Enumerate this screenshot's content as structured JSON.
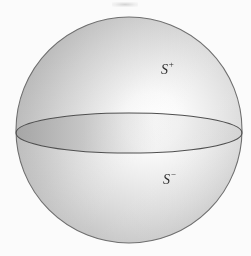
{
  "figure": {
    "caption": "",
    "background_color": "#fbfbfb",
    "width": 251,
    "height": 256
  },
  "sphere": {
    "name": "shaded-sphere",
    "center_x": 129,
    "center_y": 130,
    "radius": 113,
    "outline_color": "#6b6b6b",
    "fill_light": "#ffffff",
    "fill_mid": "#c9c9c9",
    "fill_dark": "#a6a6a6",
    "highlight_x": 162,
    "highlight_y": 122
  },
  "equator": {
    "name": "equator-ellipse",
    "center_x": 129,
    "center_y": 133,
    "radius_x": 113,
    "radius_y": 20,
    "stroke_color": "#555555",
    "band_fill": "#b4b4b4"
  },
  "labels": {
    "upper": {
      "base": "S",
      "superscript": "+",
      "x": 161,
      "y": 61,
      "color": "#2b2b2b"
    },
    "lower": {
      "base": "S",
      "superscript": "−",
      "x": 163,
      "y": 171,
      "color": "#2b2b2b"
    }
  }
}
